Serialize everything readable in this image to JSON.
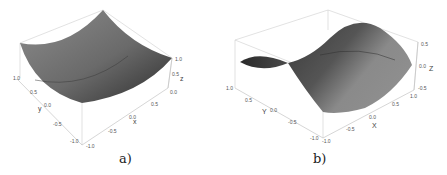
{
  "figure": {
    "panels": [
      {
        "id": "a",
        "caption": "a)",
        "surface": "paraboloid",
        "axes": {
          "x": {
            "label": "x",
            "ticks": [
              "-1.0",
              "-0.5",
              "0.0",
              "0.5"
            ]
          },
          "y": {
            "label": "y",
            "ticks": [
              "1.0",
              "0.5",
              "0.0",
              "-0.5",
              "-1.0"
            ]
          },
          "z": {
            "label": "z",
            "ticks": [
              "1.0",
              "0.5",
              "0.0"
            ]
          }
        }
      },
      {
        "id": "b",
        "caption": "b)",
        "surface": "saddle",
        "axes": {
          "x": {
            "label": "X",
            "ticks": [
              "-1.0",
              "-0.5",
              "0.0",
              "0.5",
              "1.0"
            ]
          },
          "y": {
            "label": "Y",
            "ticks": [
              "1.0",
              "0.5",
              "0.0",
              "-0.5",
              "-1.0"
            ]
          },
          "z": {
            "label": "Z",
            "ticks": [
              "0.5",
              "0.0",
              "-0.5"
            ]
          }
        }
      }
    ],
    "colors": {
      "surface_light": "#9a9a9a",
      "surface_dark": "#3a3a3a",
      "box": "#c8c8c8"
    }
  }
}
